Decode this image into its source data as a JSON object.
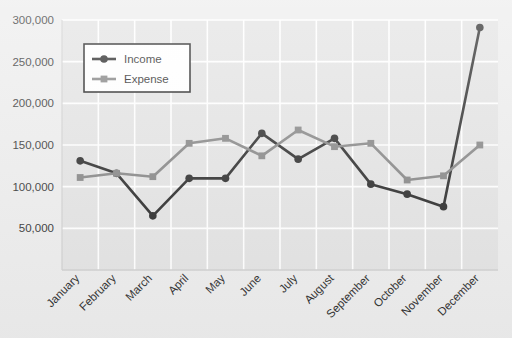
{
  "chart_data": {
    "type": "line",
    "title": "",
    "xlabel": "",
    "ylabel": "",
    "grid": true,
    "legend_position": "top-left-inside",
    "categories": [
      "January",
      "February",
      "March",
      "April",
      "May",
      "June",
      "July",
      "August",
      "September",
      "October",
      "November",
      "December"
    ],
    "ylim": [
      0,
      300000
    ],
    "yticks": [
      50000,
      100000,
      150000,
      200000,
      250000,
      300000
    ],
    "ytick_labels": [
      "50,000",
      "100,000",
      "150,000",
      "200,000",
      "250,000",
      "300,000"
    ],
    "series": [
      {
        "name": "Income",
        "color": "#222222",
        "marker": "circle",
        "values": [
          131000,
          116000,
          65000,
          110000,
          110000,
          164000,
          133000,
          158000,
          103000,
          91000,
          76000,
          291000
        ]
      },
      {
        "name": "Expense",
        "color": "#808080",
        "marker": "square",
        "values": [
          111000,
          116000,
          112000,
          152000,
          158000,
          137000,
          168000,
          148000,
          152000,
          108000,
          113000,
          150000
        ]
      }
    ]
  },
  "legend": {
    "entries": [
      {
        "label": "Income"
      },
      {
        "label": "Expense"
      }
    ]
  },
  "colors": {
    "plot_background": "#e2e2e2",
    "page_background": "#ececec",
    "gridline": "#ffffff",
    "axis": "#cfcfcf",
    "income": "#222222",
    "expense": "#808080",
    "legend_border": "#1a1a1a",
    "legend_fill": "#ffffff"
  }
}
